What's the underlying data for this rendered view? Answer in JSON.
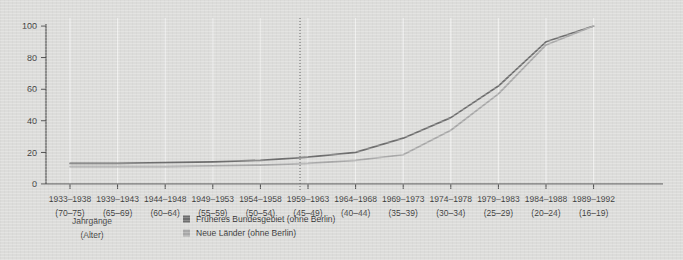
{
  "chart_data": {
    "type": "line",
    "title": "",
    "xlabel": "Jahrgänge (Alter)",
    "ylabel": "",
    "ylim": [
      0,
      100
    ],
    "yticks": [
      0,
      20,
      40,
      60,
      80,
      100
    ],
    "grid": true,
    "legend_position": "bottom",
    "categories": [
      "1933–1938",
      "1939–1943",
      "1944–1948",
      "1949–1953",
      "1954–1958",
      "1959–1963",
      "1964–1968",
      "1969–1973",
      "1974–1978",
      "1979–1983",
      "1984–1988",
      "1989–1992"
    ],
    "categories_secondary": [
      "(70–75)",
      "(65–69)",
      "(60–64)",
      "(55–59)",
      "(50–54)",
      "(45–49)",
      "(40–44)",
      "(35–39)",
      "(30–34)",
      "(25–29)",
      "(20–24)",
      "(16–19)"
    ],
    "series": [
      {
        "name": "Früheres Bundesgebiet (ohne Berlin)",
        "color": "#6f6f6f",
        "values": [
          13,
          13,
          13.5,
          14,
          15,
          17,
          20,
          29,
          42,
          62,
          90,
          100
        ]
      },
      {
        "name": "Neue Länder (ohne Berlin)",
        "color": "#a9a9a9",
        "values": [
          11,
          11,
          11,
          11.5,
          12,
          13,
          15,
          18.5,
          34,
          57,
          88,
          100
        ]
      }
    ],
    "annotations": [
      {
        "type": "vertical-divider",
        "at_category_index": 4.5,
        "style": "dotted"
      }
    ]
  },
  "axis": {
    "y_labels": [
      "0",
      "20",
      "40",
      "60",
      "80",
      "100"
    ],
    "caption_line1": "Jahrgänge",
    "caption_line2": "(Alter)"
  },
  "legend": {
    "items": [
      {
        "label": "Früheres Bundesgebiet (ohne Berlin)",
        "color": "#6f6f6f"
      },
      {
        "label": "Neue Länder (ohne Berlin)",
        "color": "#a9a9a9"
      }
    ]
  },
  "colors": {
    "background": "#dcdcda",
    "axis": "#4a4a4a",
    "grid": "#efefee",
    "series_west": "#6f6f6f",
    "series_east": "#a9a9a9"
  }
}
